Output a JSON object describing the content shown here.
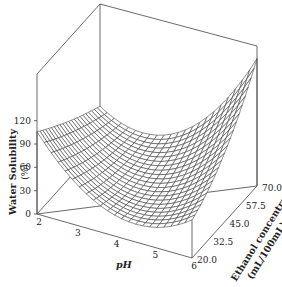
{
  "chart_data": {
    "type": "surface3d",
    "title": "",
    "xlabel": "pH",
    "ylabel": "Ethanol concentration (mL/100mL)",
    "zlabel": "Water Solubility (%)",
    "x_ticks": [
      2,
      3,
      4,
      5,
      6
    ],
    "y_ticks": [
      20.0,
      32.5,
      45.0,
      57.5,
      70.0
    ],
    "z_ticks": [
      0,
      30,
      60,
      90,
      120
    ],
    "xlim": [
      2,
      6
    ],
    "ylim": [
      20.0,
      70.0
    ],
    "zlim": [
      0,
      180
    ],
    "corner_values": [
      {
        "pH": 2,
        "ethanol": 20.0,
        "solubility": 92
      },
      {
        "pH": 2,
        "ethanol": 70.0,
        "solubility": 85
      },
      {
        "pH": 6,
        "ethanol": 20.0,
        "solubility": 45
      },
      {
        "pH": 6,
        "ethanol": 70.0,
        "solubility": 170
      }
    ],
    "minimum_approx": {
      "pH": 4.3,
      "ethanol": 30.0,
      "solubility": 22
    },
    "grid_lines": 22
  },
  "labels": {
    "zlabel_line1": "Water Solubility",
    "zlabel_line2": "(%)",
    "xlabel": "pH",
    "ylabel_line1": "Ethanol concentration",
    "ylabel_line2": "(mL/100mL)"
  }
}
